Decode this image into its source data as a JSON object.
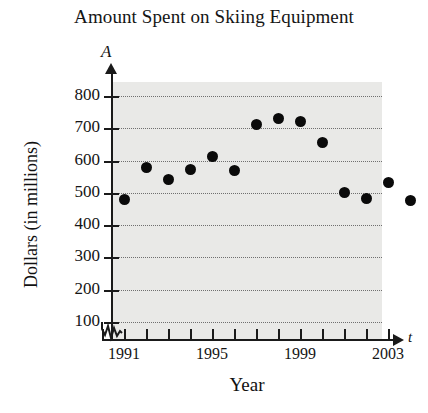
{
  "chart_data": {
    "type": "scatter",
    "title": "Amount Spent on Skiing Equipment",
    "xlabel": "Year",
    "ylabel": "Dollars (in millions)",
    "x_axis_variable": "t",
    "y_axis_variable": "A",
    "xlim": [
      1990,
      2004
    ],
    "ylim": [
      0,
      850
    ],
    "grid": true,
    "legend": null,
    "axis_break_x": true,
    "axis_break_y": true,
    "y_ticks": [
      100,
      200,
      300,
      400,
      500,
      600,
      700,
      800
    ],
    "y_tick_labels": [
      "100",
      "200",
      "300",
      "400",
      "500",
      "600",
      "700",
      "800"
    ],
    "x_ticks": [
      1990,
      1991,
      1992,
      1993,
      1994,
      1995,
      1996,
      1997,
      1998,
      1999,
      2000,
      2001,
      2002,
      2003
    ],
    "x_tick_labels": [
      "",
      "1991",
      "",
      "",
      "",
      "1995",
      "",
      "",
      "",
      "1999",
      "",
      "",
      "",
      "2003"
    ],
    "x": [
      1991,
      1992,
      1993,
      1994,
      1995,
      1996,
      1997,
      1998,
      1999,
      2000,
      2001,
      2002,
      2003,
      2004
    ],
    "values": [
      480,
      578,
      540,
      572,
      612,
      570,
      712,
      730,
      722,
      655,
      502,
      483,
      532,
      475
    ],
    "points": [
      {
        "x": 1991,
        "y": 480
      },
      {
        "x": 1992,
        "y": 578
      },
      {
        "x": 1993,
        "y": 540
      },
      {
        "x": 1994,
        "y": 572
      },
      {
        "x": 1995,
        "y": 612
      },
      {
        "x": 1996,
        "y": 570
      },
      {
        "x": 1997,
        "y": 712
      },
      {
        "x": 1998,
        "y": 730
      },
      {
        "x": 1999,
        "y": 722
      },
      {
        "x": 2000,
        "y": 655
      },
      {
        "x": 2001,
        "y": 502
      },
      {
        "x": 2002,
        "y": 483
      },
      {
        "x": 2003,
        "y": 532
      },
      {
        "x": 2004,
        "y": 475
      }
    ],
    "marker_color": "#0a0a0a",
    "plot_background": "#e9e9e7",
    "gridline_color": "#6f6f6f"
  }
}
